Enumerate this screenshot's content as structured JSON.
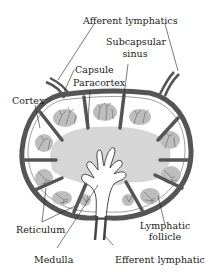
{
  "diagram": {
    "colors": {
      "capsule": "#555555",
      "trabecula": "#555555",
      "paracortex": "#d4d4d4",
      "follicle": "#b8b8b8",
      "medulla": "#ffffff",
      "reticulum": "#666666",
      "leader": "#222222"
    },
    "labels": {
      "afferent": "Afferent lymphatics",
      "subcapsular_1": "Subcapsular",
      "subcapsular_2": "sinus",
      "capsule": "Capsule",
      "paracortex": "Paracortex",
      "cortex": "Cortex",
      "reticulum": "Reticulum",
      "lymphatic_1": "Lymphatic",
      "lymphatic_2": "follicle",
      "medulla": "Medulla",
      "efferent": "Efferent lymphatic"
    }
  }
}
